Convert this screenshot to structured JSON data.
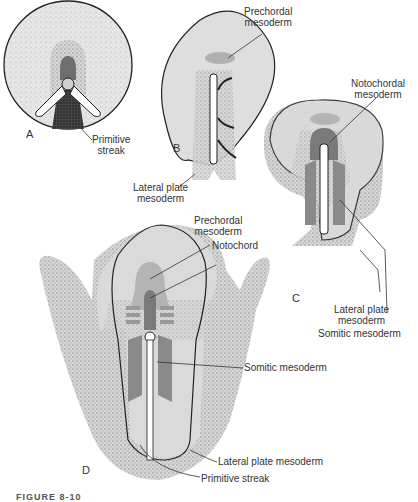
{
  "figure": {
    "caption": "FIGURE 8-10",
    "panels": [
      {
        "id": "A",
        "label": "A",
        "annotations": [
          "Primitive streak"
        ]
      },
      {
        "id": "B",
        "label": "B",
        "annotations": [
          "Prechordal mesoderm",
          "Lateral plate mesoderm"
        ]
      },
      {
        "id": "C",
        "label": "C",
        "annotations": [
          "Notochordal mesoderm",
          "Lateral plate mesoderm",
          "Somitic mesoderm"
        ]
      },
      {
        "id": "D",
        "label": "D",
        "annotations": [
          "Prechordal mesoderm",
          "Notochord",
          "Somitic mesoderm",
          "Lateral plate mesoderm",
          "Primitive streak"
        ]
      }
    ]
  },
  "labels": {
    "a_primitive_streak_1": "Primitive",
    "a_primitive_streak_2": "streak",
    "b_prechordal_1": "Prechordal",
    "b_prechordal_2": "mesoderm",
    "b_lateral_1": "Lateral plate",
    "b_lateral_2": "mesoderm",
    "c_notochordal_1": "Notochordal",
    "c_notochordal_2": "mesoderm",
    "c_lateral_1": "Lateral plate",
    "c_lateral_2": "mesoderm",
    "c_somitic": "Somitic mesoderm",
    "d_prechordal_1": "Prechordal",
    "d_prechordal_2": "mesoderm",
    "d_notochord": "Notochord",
    "d_somitic": "Somitic mesoderm",
    "d_lateral": "Lateral plate mesoderm",
    "d_primitive_streak": "Primitive streak"
  },
  "colors": {
    "embryo_fill": "#dcdcdc",
    "stipple": "#9a9a9a",
    "notochord": "#7a7a7a",
    "somitic": "#8c8c8c",
    "prechordal": "#b4b4b4",
    "outline": "#222222"
  }
}
